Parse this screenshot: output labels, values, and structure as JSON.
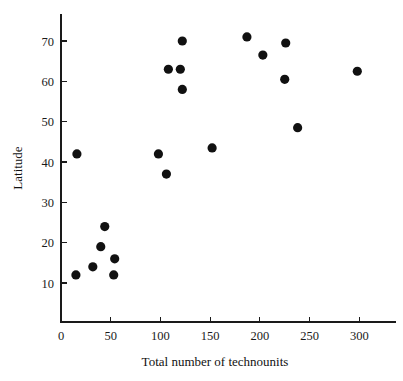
{
  "chart_data": {
    "type": "scatter",
    "title": "",
    "xlabel": "Total number of technounits",
    "ylabel": "Latitude",
    "xlim": [
      0,
      320
    ],
    "ylim": [
      3,
      76
    ],
    "xticks": [
      0,
      50,
      100,
      150,
      200,
      250,
      300
    ],
    "xtick_labels": [
      "0",
      "50",
      "100",
      "150",
      "200",
      "250",
      "300"
    ],
    "yticks": [
      10,
      20,
      30,
      40,
      50,
      60,
      70
    ],
    "ytick_labels": [
      "10",
      "20",
      "30",
      "40",
      "50",
      "60",
      "70"
    ],
    "grid": false,
    "legend": false,
    "marker": "filled-circle",
    "marker_color": "#111111",
    "marker_size": 4.6,
    "n_points": 20,
    "points": [
      {
        "x": 16,
        "y": 42.0
      },
      {
        "x": 15,
        "y": 12.0
      },
      {
        "x": 32,
        "y": 14.0
      },
      {
        "x": 40,
        "y": 19.0
      },
      {
        "x": 44,
        "y": 24.0
      },
      {
        "x": 53,
        "y": 12.0
      },
      {
        "x": 54,
        "y": 16.0
      },
      {
        "x": 98,
        "y": 42.0
      },
      {
        "x": 106,
        "y": 37.0
      },
      {
        "x": 108,
        "y": 63.0
      },
      {
        "x": 120,
        "y": 63.0
      },
      {
        "x": 122,
        "y": 70.0
      },
      {
        "x": 122,
        "y": 58.0
      },
      {
        "x": 152,
        "y": 43.5
      },
      {
        "x": 187,
        "y": 71.0
      },
      {
        "x": 203,
        "y": 66.5
      },
      {
        "x": 225,
        "y": 60.5
      },
      {
        "x": 226,
        "y": 69.5
      },
      {
        "x": 238,
        "y": 48.5
      },
      {
        "x": 298,
        "y": 62.5
      }
    ]
  },
  "axes": {
    "x_axis_label": "Total number of technounits",
    "y_axis_label": "Latitude"
  }
}
